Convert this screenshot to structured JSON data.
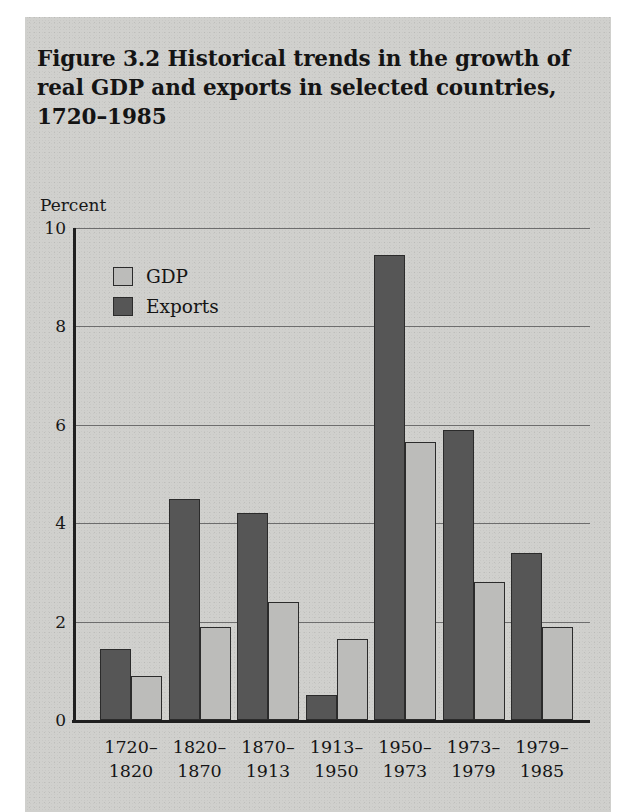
{
  "figure": {
    "title": "Figure 3.2  Historical trends in the growth of real GDP and exports in selected countries, 1720–1985",
    "unit_label": "Percent"
  },
  "legend": {
    "position": "inside-top-left",
    "items": [
      {
        "label": "GDP",
        "color": "#bcbcba",
        "key": "gdp"
      },
      {
        "label": "Exports",
        "color": "#565656",
        "key": "exports"
      }
    ]
  },
  "chart_data": {
    "type": "bar",
    "title": "Figure 3.2  Historical trends in the growth of real GDP and exports in selected countries, 1720–1985",
    "xlabel": "",
    "ylabel": "Percent",
    "ylim": [
      0,
      10
    ],
    "yticks": [
      0,
      2,
      4,
      6,
      8,
      10
    ],
    "ytick_labels": [
      "0",
      "2",
      "4",
      "6",
      "8",
      "10"
    ],
    "grid": "horizontal",
    "bar_order": [
      "Exports",
      "GDP"
    ],
    "categories": [
      "1720–1820",
      "1820–1870",
      "1870–1913",
      "1913–1950",
      "1950–1973",
      "1973–1979",
      "1979–1985"
    ],
    "series": [
      {
        "name": "Exports",
        "color": "#565656",
        "values": [
          1.45,
          4.5,
          4.2,
          0.5,
          9.45,
          5.9,
          3.4
        ]
      },
      {
        "name": "GDP",
        "color": "#bcbcba",
        "values": [
          0.9,
          1.9,
          2.4,
          1.65,
          5.65,
          2.8,
          1.9
        ]
      }
    ]
  }
}
